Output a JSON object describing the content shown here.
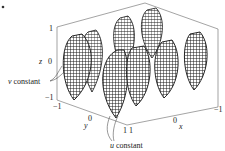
{
  "figure": {
    "type": "3d-parametric-surface-wireframe",
    "marker": "•",
    "axes": {
      "x": {
        "label": "x",
        "ticks": [
          "1",
          "0",
          "−1"
        ]
      },
      "y": {
        "label": "y",
        "ticks": [
          "−1",
          "0",
          "1"
        ]
      },
      "z": {
        "label": "z",
        "ticks": [
          "1",
          "0",
          "−1"
        ]
      }
    },
    "annotations": {
      "v_constant": {
        "var": "v",
        "text": " constant"
      },
      "u_constant": {
        "var": "u",
        "text": " constant"
      }
    },
    "colors": {
      "mesh": "#1a1a1a",
      "box": "#555555",
      "fill": "#ffffff"
    }
  }
}
